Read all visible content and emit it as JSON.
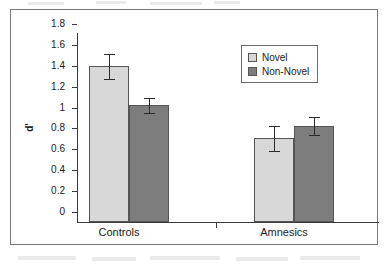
{
  "chart_data": {
    "type": "bar",
    "title": "",
    "subtitle": "",
    "xlabel": "",
    "ylabel": "d'",
    "categories": [
      "Controls",
      "Amnesics"
    ],
    "series": [
      {
        "name": "Novel",
        "color": "#d8d8d8",
        "values": [
          1.49,
          0.8
        ],
        "errors_low": [
          1.37,
          0.68
        ],
        "errors_high": [
          1.61,
          0.92
        ]
      },
      {
        "name": "Non-Novel",
        "color": "#7d7d7d",
        "values": [
          1.12,
          0.92
        ],
        "errors_low": [
          1.04,
          0.83
        ],
        "errors_high": [
          1.19,
          1.01
        ]
      }
    ],
    "ylim": [
      0,
      1.8
    ],
    "ytick_step": 0.2,
    "ytick_labels": [
      "1.8",
      "1.6",
      "1.4",
      "1.2",
      "1",
      "0.8",
      "0.6",
      "0.4",
      "0.2",
      "0"
    ],
    "ytick_values": [
      1.8,
      1.6,
      1.4,
      1.2,
      1.0,
      0.8,
      0.6,
      0.4,
      0.2,
      0
    ],
    "grid": false,
    "legend_position": "top-right",
    "error_bar_type": "standard-error"
  },
  "legend": {
    "items": [
      {
        "label": "Novel",
        "color": "#d8d8d8"
      },
      {
        "label": "Non-Novel",
        "color": "#7d7d7d"
      }
    ]
  },
  "axes": {
    "y_title": "d'",
    "x_labels": [
      "Controls",
      "Amnesics"
    ]
  }
}
